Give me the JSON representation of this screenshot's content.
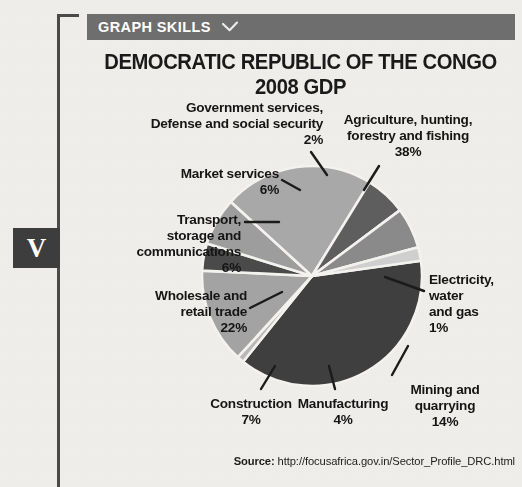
{
  "page": {
    "background_color": "#f2f0ec",
    "rule_color": "#4a4a4a",
    "marker_label": "V",
    "marker_bg": "#3d3d3d"
  },
  "header": {
    "label": "GRAPH SKILLS",
    "chevron_icon": "chevron-down-icon",
    "bar_color": "#6e6e6e",
    "text_color": "#ffffff"
  },
  "chart_title": "DEMOCRATIC REPUBLIC OF THE CONGO 2008 GDP",
  "source": {
    "label": "Source:",
    "url": "http://focusafrica.gov.in/Sector_Profile_DRC.html"
  },
  "labels": {
    "agriculture": "Agriculture, hunting,\nforestry and fishing\n38%",
    "electricity": "Electricity,\nwater\nand gas\n1%",
    "mining": "Mining and\nquarrying\n14%",
    "manufacturing": "Manufacturing\n4%",
    "construction": "Construction\n7%",
    "wholesale": "Wholesale and\nretail trade\n22%",
    "transport": "Transport,\nstorage and\ncommunications\n6%",
    "market": "Market services\n6%",
    "government": "Government services,\nDefense and social security\n2%"
  },
  "chart_data": {
    "type": "pie",
    "title": "DEMOCRATIC REPUBLIC OF THE CONGO 2008 GDP",
    "unit": "percent",
    "legend": "none",
    "labels_position": "outside-with-leader-lines",
    "start_angle_deg": -8,
    "direction": "clockwise",
    "categories": [
      "Agriculture, hunting, forestry and fishing",
      "Electricity, water and gas",
      "Mining and quarrying",
      "Manufacturing",
      "Construction",
      "Wholesale and retail trade",
      "Transport, storage and communications",
      "Market services",
      "Government services, Defense and social security"
    ],
    "values": [
      38,
      1,
      14,
      4,
      7,
      22,
      6,
      6,
      2
    ],
    "colors": [
      "#3f3f3f",
      "#b8b8b8",
      "#a3a3a3",
      "#4a4a4a",
      "#9d9d9d",
      "#a8a8a8",
      "#5e5e5e",
      "#8a8a8a",
      "#cfcfcf"
    ],
    "slice_gap": "white separator strokes"
  }
}
